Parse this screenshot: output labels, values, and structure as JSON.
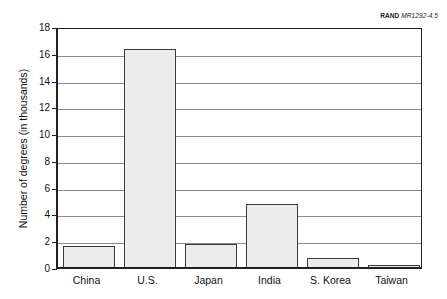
{
  "credit": {
    "brand": "RAND",
    "code": "MR1292-4.5"
  },
  "chart_data": {
    "type": "bar",
    "title": "",
    "xlabel": "",
    "ylabel": "Number of degrees (in thousands)",
    "categories": [
      "China",
      "U.S.",
      "Japan",
      "India",
      "S. Korea",
      "Taiwan"
    ],
    "values": [
      1.6,
      16.3,
      1.7,
      4.7,
      0.7,
      0.1
    ],
    "ylim": [
      0,
      18
    ],
    "ytick_step": 2,
    "ytick_labels": [
      "0",
      "2",
      "4",
      "6",
      "8",
      "10",
      "12",
      "14",
      "16",
      "18"
    ],
    "grid": true,
    "legend": "none",
    "bar_fill_color": "#ececec",
    "bar_border_color": "#3a3a3a",
    "gridline_color": "#8a8a8a",
    "axis_color": "#231f20"
  }
}
